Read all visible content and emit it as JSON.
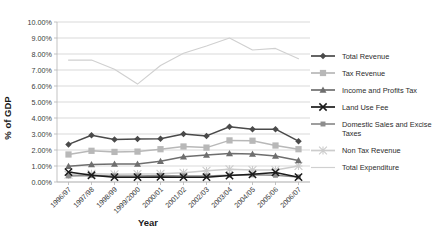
{
  "chart_data": {
    "type": "line",
    "title": "",
    "xlabel": "Year",
    "ylabel": "% of GDP",
    "ylim": [
      0,
      10
    ],
    "ytick_labels": [
      "0.00%",
      "1.00%",
      "2.00%",
      "3.00%",
      "4.00%",
      "5.00%",
      "6.00%",
      "7.00%",
      "8.00%",
      "9.00%",
      "10.00%"
    ],
    "ytick_values": [
      0,
      1,
      2,
      3,
      4,
      5,
      6,
      7,
      8,
      9,
      10
    ],
    "grid": true,
    "legend_position": "right",
    "categories": [
      "1996/97",
      "1997/98",
      "1998/99",
      "1999/2000",
      "2000/01",
      "2001/02",
      "2002/03",
      "2003/04",
      "2004/05",
      "2005/06",
      "2006/07"
    ],
    "series": [
      {
        "name": "Total Revenue",
        "color": "#4a4a4a",
        "marker": "diamond",
        "values": [
          2.35,
          2.92,
          2.65,
          2.68,
          2.7,
          3.0,
          2.88,
          3.45,
          3.3,
          3.3,
          2.55
        ]
      },
      {
        "name": "Tax Revenue",
        "color": "#b8b8b8",
        "marker": "square",
        "values": [
          1.72,
          1.95,
          1.88,
          1.9,
          2.05,
          2.22,
          2.15,
          2.6,
          2.58,
          2.28,
          2.05
        ]
      },
      {
        "name": "Income and Profits Tax",
        "color": "#6e6e6e",
        "marker": "triangle",
        "values": [
          0.98,
          1.1,
          1.12,
          1.12,
          1.3,
          1.58,
          1.68,
          1.78,
          1.75,
          1.62,
          1.35
        ]
      },
      {
        "name": "Land Use Fee",
        "color": "#1c1c1c",
        "marker": "cross",
        "values": [
          0.62,
          0.42,
          0.3,
          0.3,
          0.32,
          0.3,
          0.3,
          0.4,
          0.48,
          0.6,
          0.3
        ]
      },
      {
        "name": "Domestic Sales and Excise Taxes",
        "color": "#8d8d8d",
        "marker": "square-small",
        "values": [
          0.38,
          0.4,
          0.38,
          0.38,
          0.4,
          0.38,
          0.38,
          0.42,
          0.45,
          0.42,
          0.32
        ]
      },
      {
        "name": "Non Tax Revenue",
        "color": "#cccccc",
        "marker": "star",
        "values": [
          0.45,
          0.52,
          0.48,
          0.5,
          0.52,
          0.58,
          0.7,
          0.8,
          0.75,
          0.75,
          1.0
        ]
      },
      {
        "name": "Total Expenditure",
        "color": "#d0d0d0",
        "marker": "none",
        "values": [
          7.62,
          7.62,
          7.05,
          6.12,
          7.28,
          8.05,
          8.5,
          9.0,
          8.25,
          8.35,
          7.7
        ]
      }
    ]
  },
  "legend": {
    "items": [
      {
        "label": "Total Revenue"
      },
      {
        "label": "Tax Revenue"
      },
      {
        "label": "Income and Profits Tax"
      },
      {
        "label": "Land Use Fee"
      },
      {
        "label": "Domestic Sales and Excise Taxes"
      },
      {
        "label": "Non Tax Revenue"
      },
      {
        "label": "Total Expenditure"
      }
    ]
  }
}
